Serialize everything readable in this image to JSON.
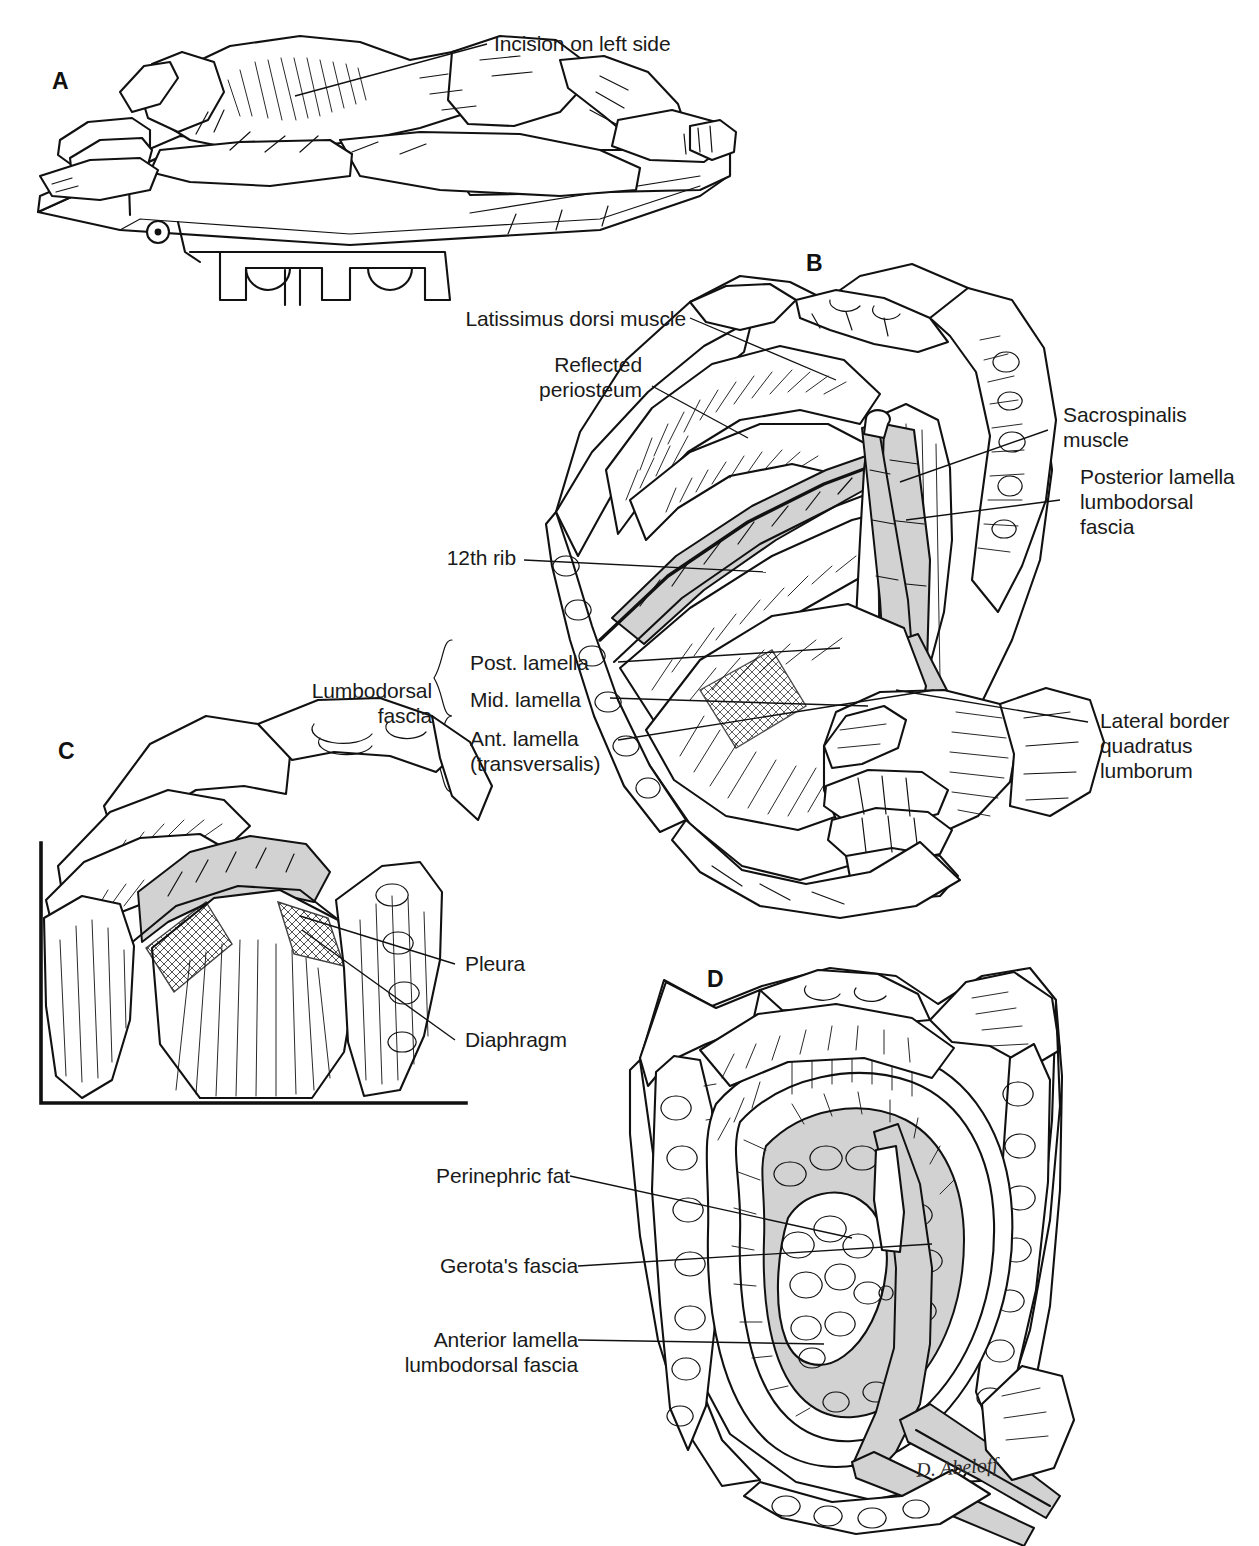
{
  "figure": {
    "type": "surgical-anatomy-plate",
    "background_color": "#ffffff",
    "ink_color": "#111111",
    "shading_color": "#d0d0d0",
    "artist_signature": "D. Abeloff"
  },
  "panels": [
    {
      "id": "A",
      "letter": "A",
      "caption_subject": "Patient positioned in lateral decubitus on flexed operating table",
      "labels": [
        {
          "id": "incision-left-side",
          "text": "Incision on left side"
        }
      ]
    },
    {
      "id": "B",
      "letter": "B",
      "caption_subject": "Exposure of the twelfth rib, lumbodorsal fascia lamellae and quadratus lumborum",
      "labels": [
        {
          "id": "latissimus-dorsi-muscle",
          "text": "Latissimus dorsi muscle"
        },
        {
          "id": "reflected-periosteum",
          "text": "Reflected\nperiosteum"
        },
        {
          "id": "twelfth-rib",
          "text": "12th rib"
        },
        {
          "id": "lumbodorsal-fascia",
          "text": "Lumbodorsal\nfascia"
        },
        {
          "id": "post-lamella",
          "text": "Post. lamella"
        },
        {
          "id": "mid-lamella",
          "text": "Mid. lamella"
        },
        {
          "id": "ant-lamella-transversalis",
          "text": "Ant. lamella\n(transversalis)"
        },
        {
          "id": "sacrospinalis-muscle",
          "text": "Sacrospinalis\nmuscle"
        },
        {
          "id": "posterior-lamella-lumbodorsal-fascia",
          "text": "Posterior lamella\nlumbodorsal\nfascia"
        },
        {
          "id": "lateral-border-quadratus-lumborum",
          "text": "Lateral border\nquadratus\nlumborum"
        }
      ]
    },
    {
      "id": "C",
      "letter": "C",
      "caption_subject": "Bed of the resected rib showing pleura and diaphragm",
      "labels": [
        {
          "id": "pleura",
          "text": "Pleura"
        },
        {
          "id": "diaphragm",
          "text": "Diaphragm"
        }
      ]
    },
    {
      "id": "D",
      "letter": "D",
      "caption_subject": "Gerota's fascia opened exposing perinephric fat and kidney",
      "labels": [
        {
          "id": "perinephric-fat",
          "text": "Perinephric fat"
        },
        {
          "id": "gerotas-fascia",
          "text": "Gerota's fascia"
        },
        {
          "id": "anterior-lamella-lumbodorsal-fascia",
          "text": "Anterior lamella\nlumbodorsal fascia"
        }
      ]
    }
  ]
}
